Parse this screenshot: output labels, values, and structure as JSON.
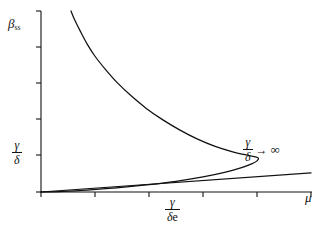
{
  "chart_data": {
    "type": "line",
    "title": "",
    "subtitle": "",
    "xlabel": "μ",
    "ylabel": "β",
    "ylabel_subscript": "ss",
    "grid": false,
    "legend": "none",
    "axis": {
      "x_range": [
        0,
        1.0
      ],
      "y_range": [
        0,
        1.0
      ],
      "x_tick_count": 6,
      "y_tick_count": 6,
      "x_tick_positions": [
        0.0,
        0.2,
        0.4,
        0.6,
        0.8,
        1.0
      ],
      "y_tick_positions": [
        0.0,
        0.2,
        0.4,
        0.6,
        0.8,
        1.0
      ]
    },
    "tick_labels": {
      "y_labeled_tick": {
        "value": 0.205,
        "numerator": "γ",
        "denominator": "δ"
      },
      "x_labeled_tick": {
        "value": 0.4,
        "numerator": "γ",
        "denominator": "δe"
      }
    },
    "annotations": [
      {
        "name": "asymptote-label",
        "numerator": "γ",
        "denominator": "δ",
        "arrow": "→",
        "limit": "∞",
        "x": 0.78,
        "y": 0.255
      }
    ],
    "series": [
      {
        "name": "steady-state-branch",
        "description": "S-shaped fold curve with turning point (nose)",
        "points": [
          [
            0.111,
            1.0
          ],
          [
            0.125,
            0.95
          ],
          [
            0.145,
            0.89
          ],
          [
            0.17,
            0.82
          ],
          [
            0.2,
            0.75
          ],
          [
            0.24,
            0.675
          ],
          [
            0.285,
            0.6
          ],
          [
            0.335,
            0.53
          ],
          [
            0.39,
            0.462
          ],
          [
            0.45,
            0.4
          ],
          [
            0.515,
            0.342
          ],
          [
            0.58,
            0.292
          ],
          [
            0.645,
            0.252
          ],
          [
            0.71,
            0.222
          ],
          [
            0.76,
            0.205
          ],
          [
            0.79,
            0.196
          ],
          [
            0.805,
            0.188
          ],
          [
            0.8,
            0.172
          ],
          [
            0.78,
            0.155
          ],
          [
            0.74,
            0.133
          ],
          [
            0.68,
            0.108
          ],
          [
            0.6,
            0.083
          ],
          [
            0.5,
            0.059
          ],
          [
            0.39,
            0.039
          ],
          [
            0.28,
            0.023
          ],
          [
            0.17,
            0.011
          ],
          [
            0.08,
            0.004
          ],
          [
            0.0,
            0.0
          ]
        ],
        "fold_point": {
          "x": 0.805,
          "y": 0.188
        }
      },
      {
        "name": "limiting-asymptote-line",
        "description": "Straight line through origin for gamma/delta tending to infinity",
        "points": [
          [
            0.0,
            0.0
          ],
          [
            1.0,
            0.105
          ]
        ]
      }
    ],
    "colors": {
      "axis": "#111111",
      "curve": "#111111",
      "line": "#111111",
      "background": "#ffffff"
    }
  },
  "figure": {
    "y_axis_label": "β",
    "y_axis_label_subscript": "ss",
    "x_axis_label": "μ",
    "y_tick_numerator": "γ",
    "y_tick_denominator": "δ",
    "x_tick_numerator": "γ",
    "x_tick_denominator_gamma": "δ",
    "x_tick_denominator_e": "e",
    "annotation_numerator": "γ",
    "annotation_denominator": "δ",
    "annotation_arrow": "→",
    "annotation_limit": "∞"
  }
}
